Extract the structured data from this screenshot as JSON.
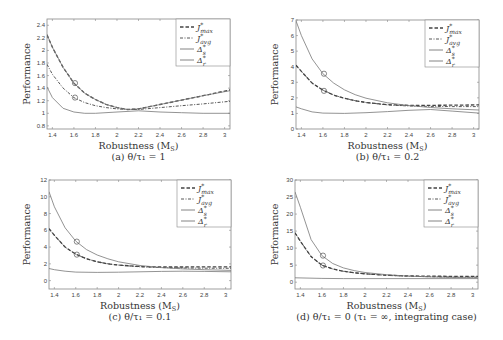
{
  "chart_data": [
    {
      "id": "a",
      "type": "line",
      "caption": "(a) θ/τ₁ = 1",
      "xlabel": "Robustness (M_S)",
      "ylabel": "Performance",
      "xlim": [
        1.35,
        3.05
      ],
      "ylim": [
        0.75,
        2.5
      ],
      "xticks": [
        1.4,
        1.6,
        1.8,
        2,
        2.2,
        2.4,
        2.6,
        2.8,
        3
      ],
      "xtick_labels": [
        "1.4",
        "1.6",
        "1.8",
        "2",
        "2.2",
        "2.4",
        "2.6",
        "2.8",
        "3"
      ],
      "yticks": [
        0.8,
        1,
        1.2,
        1.4,
        1.6,
        1.8,
        2,
        2.2,
        2.4
      ],
      "ytick_labels": [
        "0.8",
        "1",
        "1.2",
        "1.4",
        "1.6",
        "1.8",
        "2",
        "2.2",
        "2.4"
      ],
      "grid": false,
      "legend_position": "upper right",
      "series": [
        {
          "name": "J*_max",
          "style": "dashed",
          "x": [
            1.35,
            1.4,
            1.5,
            1.6,
            1.7,
            1.8,
            1.9,
            2.0,
            2.1,
            2.2,
            2.4,
            2.6,
            2.8,
            3.05
          ],
          "y": [
            2.25,
            2.05,
            1.73,
            1.48,
            1.32,
            1.22,
            1.14,
            1.09,
            1.06,
            1.07,
            1.14,
            1.21,
            1.28,
            1.37
          ]
        },
        {
          "name": "J*_avg",
          "style": "dashdot",
          "x": [
            1.35,
            1.4,
            1.5,
            1.6,
            1.7,
            1.8,
            1.9,
            2.0,
            2.1,
            2.2,
            2.4,
            2.6,
            2.8,
            3.05
          ],
          "y": [
            1.78,
            1.62,
            1.4,
            1.25,
            1.17,
            1.12,
            1.09,
            1.07,
            1.06,
            1.06,
            1.09,
            1.12,
            1.15,
            1.19
          ]
        },
        {
          "name": "Δ*_s",
          "style": "solid",
          "x": [
            1.35,
            1.4,
            1.5,
            1.6,
            1.7,
            1.8,
            1.9,
            2.0,
            2.1,
            2.2,
            2.4,
            2.6,
            2.8,
            3.05
          ],
          "y": [
            2.25,
            2.05,
            1.73,
            1.48,
            1.32,
            1.22,
            1.14,
            1.09,
            1.06,
            1.07,
            1.14,
            1.21,
            1.28,
            1.36
          ]
        },
        {
          "name": "Δ*_r",
          "style": "solid",
          "x": [
            1.35,
            1.4,
            1.5,
            1.6,
            1.7,
            1.8,
            2.0,
            2.2,
            2.4,
            2.6,
            2.8,
            3.05
          ],
          "y": [
            1.42,
            1.25,
            1.08,
            1.02,
            1.0,
            1.0,
            1.02,
            1.04,
            1.02,
            1.01,
            1.0,
            1.0
          ]
        }
      ],
      "markers": [
        {
          "x": 1.61,
          "y": 1.48
        },
        {
          "x": 1.61,
          "y": 1.25
        }
      ]
    },
    {
      "id": "b",
      "type": "line",
      "caption": "(b) θ/τ₁ = 0.2",
      "xlabel": "Robustness (M_S)",
      "ylabel": "Performance",
      "xlim": [
        1.35,
        3.05
      ],
      "ylim": [
        0,
        7
      ],
      "xticks": [
        1.4,
        1.6,
        1.8,
        2,
        2.2,
        2.4,
        2.6,
        2.8,
        3
      ],
      "xtick_labels": [
        "1.4",
        "1.6",
        "1.8",
        "2",
        "2.2",
        "2.4",
        "2.6",
        "2.8",
        "3"
      ],
      "yticks": [
        0,
        1,
        2,
        3,
        4,
        5,
        6,
        7
      ],
      "ytick_labels": [
        "0",
        "1",
        "2",
        "3",
        "4",
        "5",
        "6",
        "7"
      ],
      "grid": false,
      "legend_position": "upper right",
      "series": [
        {
          "name": "J*_max",
          "style": "dashed",
          "x": [
            1.35,
            1.4,
            1.5,
            1.6,
            1.7,
            1.8,
            1.9,
            2.0,
            2.2,
            2.4,
            2.6,
            2.8,
            3.05
          ],
          "y": [
            4.1,
            3.7,
            2.95,
            2.5,
            2.18,
            1.98,
            1.82,
            1.7,
            1.56,
            1.52,
            1.52,
            1.53,
            1.55
          ]
        },
        {
          "name": "J*_avg",
          "style": "dashdot",
          "x": [
            1.35,
            1.4,
            1.5,
            1.6,
            1.7,
            1.8,
            1.9,
            2.0,
            2.2,
            2.4,
            2.6,
            2.8,
            3.05
          ],
          "y": [
            4.1,
            3.7,
            2.95,
            2.5,
            2.18,
            1.98,
            1.82,
            1.7,
            1.55,
            1.48,
            1.45,
            1.44,
            1.44
          ]
        },
        {
          "name": "Δ*_s",
          "style": "solid",
          "x": [
            1.35,
            1.4,
            1.5,
            1.6,
            1.7,
            1.8,
            1.9,
            2.0,
            2.2,
            2.4,
            2.6,
            2.8,
            3.05
          ],
          "y": [
            6.95,
            6.0,
            4.5,
            3.55,
            2.95,
            2.52,
            2.2,
            1.98,
            1.68,
            1.5,
            1.38,
            1.3,
            1.22
          ]
        },
        {
          "name": "Δ*_r",
          "style": "solid",
          "x": [
            1.35,
            1.4,
            1.5,
            1.6,
            1.8,
            2.0,
            2.2,
            2.4,
            2.6,
            2.8,
            3.05
          ],
          "y": [
            1.42,
            1.3,
            1.1,
            1.02,
            1.0,
            1.05,
            1.12,
            1.2,
            1.25,
            1.15,
            1.02
          ]
        }
      ],
      "markers": [
        {
          "x": 1.61,
          "y": 3.55
        },
        {
          "x": 1.61,
          "y": 2.45
        }
      ]
    },
    {
      "id": "c",
      "type": "line",
      "caption": "(c) θ/τ₁ = 0.1",
      "xlabel": "Robustness (M_S)",
      "ylabel": "Performance",
      "xlim": [
        1.35,
        3.05
      ],
      "ylim": [
        -1,
        12
      ],
      "xticks": [
        1.4,
        1.6,
        1.8,
        2,
        2.2,
        2.4,
        2.6,
        2.8,
        3
      ],
      "xtick_labels": [
        "1.4",
        "1.6",
        "1.8",
        "2",
        "2.2",
        "2.4",
        "2.6",
        "2.8",
        "3"
      ],
      "yticks": [
        0,
        2,
        4,
        6,
        8,
        10,
        12
      ],
      "ytick_labels": [
        "0",
        "2",
        "4",
        "6",
        "8",
        "10",
        "12"
      ],
      "grid": false,
      "legend_position": "upper right",
      "series": [
        {
          "name": "J*_max",
          "style": "dashed",
          "x": [
            1.35,
            1.4,
            1.5,
            1.6,
            1.7,
            1.8,
            1.9,
            2.0,
            2.2,
            2.4,
            2.6,
            2.8,
            3.05
          ],
          "y": [
            6.2,
            5.4,
            4.0,
            3.15,
            2.6,
            2.25,
            2.0,
            1.85,
            1.68,
            1.62,
            1.62,
            1.63,
            1.65
          ]
        },
        {
          "name": "J*_avg",
          "style": "dashdot",
          "x": [
            1.35,
            1.4,
            1.5,
            1.6,
            1.7,
            1.8,
            1.9,
            2.0,
            2.2,
            2.4,
            2.6,
            2.8,
            3.05
          ],
          "y": [
            6.2,
            5.4,
            4.0,
            3.15,
            2.6,
            2.25,
            2.0,
            1.85,
            1.65,
            1.55,
            1.5,
            1.48,
            1.47
          ]
        },
        {
          "name": "Δ*_s",
          "style": "solid",
          "x": [
            1.35,
            1.4,
            1.5,
            1.6,
            1.7,
            1.8,
            1.9,
            2.0,
            2.2,
            2.4,
            2.6,
            2.8,
            3.05
          ],
          "y": [
            10.6,
            8.8,
            6.3,
            4.7,
            3.7,
            3.05,
            2.6,
            2.25,
            1.8,
            1.55,
            1.4,
            1.3,
            1.22
          ]
        },
        {
          "name": "Δ*_r",
          "style": "solid",
          "x": [
            1.35,
            1.4,
            1.5,
            1.6,
            1.8,
            2.0,
            2.2,
            2.4,
            2.6,
            2.8,
            3.05
          ],
          "y": [
            1.45,
            1.3,
            1.12,
            1.02,
            0.98,
            1.0,
            1.05,
            1.1,
            1.12,
            1.1,
            1.05
          ]
        }
      ],
      "markers": [
        {
          "x": 1.61,
          "y": 4.65
        },
        {
          "x": 1.61,
          "y": 3.1
        }
      ]
    },
    {
      "id": "d",
      "type": "line",
      "caption": "(d) θ/τ₁ = 0 (τ₁ = ∞, integrating case)",
      "xlabel": "Robustness (M_S)",
      "ylabel": "Performance",
      "xlim": [
        1.35,
        3.05
      ],
      "ylim": [
        -2,
        30
      ],
      "xticks": [
        1.4,
        1.6,
        1.8,
        2,
        2.2,
        2.4,
        2.6,
        2.8,
        3
      ],
      "xtick_labels": [
        "1.4",
        "1.6",
        "1.8",
        "2",
        "2.2",
        "2.4",
        "2.6",
        "2.8",
        "3"
      ],
      "yticks": [
        0,
        5,
        10,
        15,
        20,
        25,
        30
      ],
      "ytick_labels": [
        "0",
        "5",
        "10",
        "15",
        "20",
        "25",
        "30"
      ],
      "grid": false,
      "legend_position": "upper right",
      "series": [
        {
          "name": "J*_max",
          "style": "dashed",
          "x": [
            1.35,
            1.4,
            1.5,
            1.6,
            1.7,
            1.8,
            1.9,
            2.0,
            2.2,
            2.4,
            2.6,
            2.8,
            3.05
          ],
          "y": [
            14.5,
            12.0,
            7.5,
            5.0,
            3.9,
            3.2,
            2.75,
            2.45,
            2.05,
            1.85,
            1.75,
            1.72,
            1.72
          ]
        },
        {
          "name": "J*_avg",
          "style": "dashdot",
          "x": [
            1.35,
            1.4,
            1.5,
            1.6,
            1.7,
            1.8,
            1.9,
            2.0,
            2.2,
            2.4,
            2.6,
            2.8,
            3.05
          ],
          "y": [
            14.5,
            12.0,
            7.5,
            5.0,
            3.9,
            3.2,
            2.75,
            2.45,
            2.0,
            1.75,
            1.6,
            1.52,
            1.48
          ]
        },
        {
          "name": "Δ*_s",
          "style": "solid",
          "x": [
            1.35,
            1.4,
            1.5,
            1.6,
            1.7,
            1.8,
            1.9,
            2.0,
            2.2,
            2.4,
            2.6,
            2.8,
            3.05
          ],
          "y": [
            26.5,
            22.0,
            12.5,
            7.8,
            5.5,
            4.2,
            3.4,
            2.85,
            2.2,
            1.8,
            1.55,
            1.4,
            1.3
          ]
        },
        {
          "name": "Δ*_r",
          "style": "solid",
          "x": [
            1.35,
            1.6,
            1.8,
            2.0,
            2.4,
            2.8,
            3.05
          ],
          "y": [
            1.3,
            1.1,
            1.05,
            1.05,
            1.05,
            1.05,
            1.05
          ]
        }
      ],
      "markers": [
        {
          "x": 1.61,
          "y": 7.8
        },
        {
          "x": 1.61,
          "y": 4.9
        }
      ]
    }
  ],
  "panels": [
    {
      "caption": "(a) θ/τ₁ = 1",
      "xlabel": "Robustness (M",
      "xlabel_sub": "S",
      "ylabel": "Performance"
    },
    {
      "caption": "(b) θ/τ₁ = 0.2",
      "xlabel": "Robustness (M",
      "xlabel_sub": "S",
      "ylabel": "Performance"
    },
    {
      "caption": "(c) θ/τ₁ = 0.1",
      "xlabel": "Robustness (M",
      "xlabel_sub": "S",
      "ylabel": "Performance"
    },
    {
      "caption": "(d) θ/τ₁ = 0 (τ₁ = ∞, integrating case)",
      "xlabel": "Robustness (M",
      "xlabel_sub": "S",
      "ylabel": "Performance"
    }
  ],
  "legend": [
    {
      "symbol": "J",
      "sup": "*",
      "sub": "max",
      "style": "dashed"
    },
    {
      "symbol": "J",
      "sup": "*",
      "sub": "avg",
      "style": "dashdot"
    },
    {
      "symbol": "Δ",
      "sup": "*",
      "sub": "s",
      "style": "solid"
    },
    {
      "symbol": "Δ",
      "sup": "*",
      "sub": "r",
      "style": "solid"
    }
  ],
  "colors": {
    "line": "#444444",
    "light_line": "#777777",
    "axis": "#888888",
    "text": "#333333"
  }
}
